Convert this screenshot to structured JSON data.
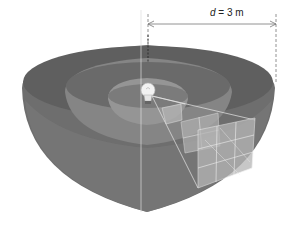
{
  "figure": {
    "distance_label": {
      "variable": "d",
      "equals": " = 3 m"
    },
    "colors": {
      "outer_shell": "#6b6b6b",
      "middle_shell": "#7a7a7a",
      "inner_shell": "#8a8a8a",
      "patch": "#b0b0b0",
      "grid_lines": "#e8e8e8",
      "dimension_line": "#666666"
    },
    "shells": 3,
    "grid_patches": [
      {
        "shell": "inner",
        "divisions": "1x1"
      },
      {
        "shell": "middle",
        "divisions": "2x2"
      },
      {
        "shell": "outer",
        "divisions": "3x3"
      }
    ]
  }
}
